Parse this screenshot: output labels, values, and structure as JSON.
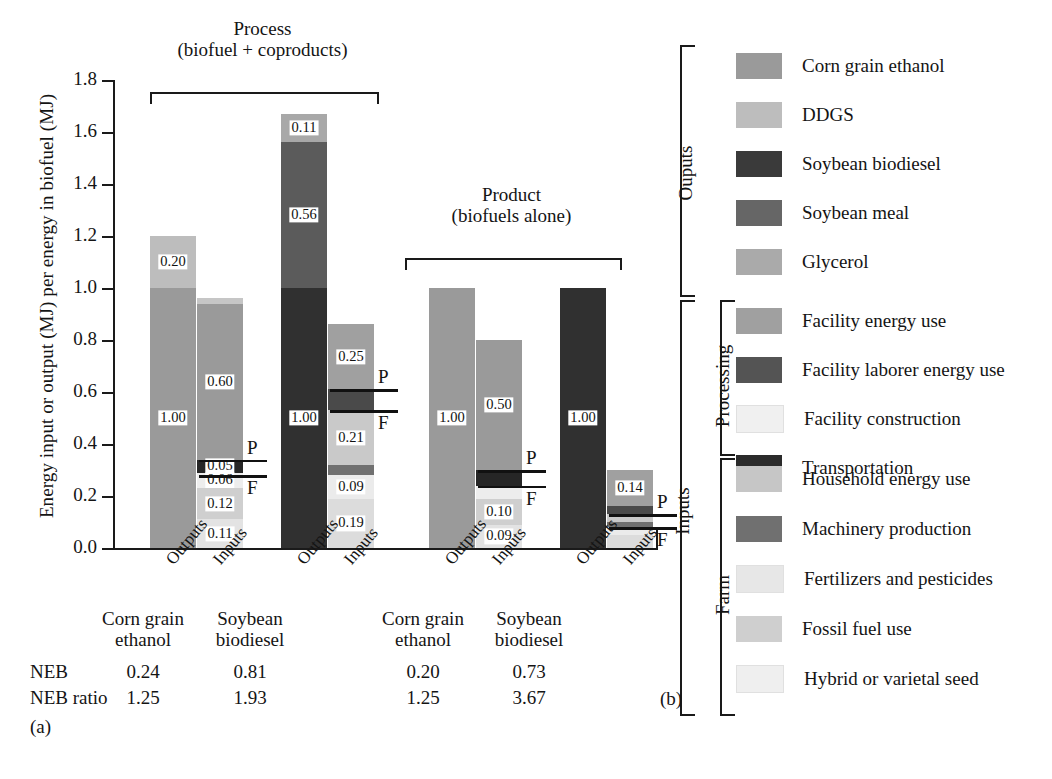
{
  "figure": {
    "panel_a_tag": "(a)",
    "panel_b_tag": "(b)",
    "ylabel": "Energy input or output (MJ) per energy in biofuel (MJ)"
  },
  "chart_data": {
    "type": "bar",
    "title": "",
    "xlabel": "",
    "ylabel": "Energy input or output (MJ) per energy in biofuel (MJ)",
    "ylim": [
      0,
      1.8
    ],
    "yticks": [
      "0.0",
      "0.2",
      "0.4",
      "0.6",
      "0.8",
      "1.0",
      "1.2",
      "1.4",
      "1.6",
      "1.8"
    ],
    "grid": false,
    "legend_position": "right",
    "stacked": true,
    "group_headers": [
      {
        "title_line1": "Process",
        "title_line2": "(biofuel + coproducts)"
      },
      {
        "title_line1": "Product",
        "title_line2": "(biofuels alone)"
      }
    ],
    "categories": [
      {
        "label_line1": "Corn grain",
        "label_line2": "ethanol"
      },
      {
        "label_line1": "Soybean",
        "label_line2": "biodiesel"
      },
      {
        "label_line1": "Corn grain",
        "label_line2": "ethanol"
      },
      {
        "label_line1": "Soybean",
        "label_line2": "biodiesel"
      }
    ],
    "bar_axis_labels": [
      "Outputs",
      "Inputs",
      "Outputs",
      "Inputs",
      "Outputs",
      "Inputs",
      "Outputs",
      "Inputs"
    ],
    "bars": [
      {
        "group": "Process",
        "crop": "Corn grain ethanol",
        "side": "Outputs",
        "total": 1.2,
        "segments": [
          {
            "series": "Corn grain ethanol",
            "value": 1.0,
            "label": "1.00",
            "color": "#9a9a9a"
          },
          {
            "series": "DDGS",
            "value": 0.2,
            "label": "0.20",
            "color": "#bdbdbd"
          }
        ]
      },
      {
        "group": "Process",
        "crop": "Corn grain ethanol",
        "side": "Inputs",
        "total": 0.96,
        "segments": [
          {
            "series": "Hybrid or varietal seed",
            "value": 0.11,
            "label": "0.11",
            "color": "#e3e3e3"
          },
          {
            "series": "Fossil fuel use",
            "value": 0.12,
            "label": "0.12",
            "color": "#cfcfcf"
          },
          {
            "series": "Fertilizers and pesticides",
            "value": 0.06,
            "label": "0.06",
            "color": "#ededed"
          },
          {
            "series": "Machinery production",
            "value": 0.05,
            "label": "0.05",
            "color": "#262626"
          },
          {
            "series": "Facility energy use",
            "value": 0.6,
            "label": "0.60",
            "color": "#9a9a9a"
          },
          {
            "series": "Household energy use",
            "value": 0.02,
            "label": "",
            "color": "#c6c6c6"
          }
        ],
        "pf_marks": [
          {
            "mark": "P",
            "value": 0.34
          },
          {
            "mark": "F",
            "value": 0.28
          }
        ]
      },
      {
        "group": "Process",
        "crop": "Soybean biodiesel",
        "side": "Outputs",
        "total": 1.67,
        "segments": [
          {
            "series": "Soybean biodiesel",
            "value": 1.0,
            "label": "1.00",
            "color": "#303030"
          },
          {
            "series": "Soybean meal",
            "value": 0.56,
            "label": "0.56",
            "color": "#5b5b5b"
          },
          {
            "series": "Glycerol",
            "value": 0.11,
            "label": "0.11",
            "color": "#a8a8a8"
          }
        ]
      },
      {
        "group": "Process",
        "crop": "Soybean biodiesel",
        "side": "Inputs",
        "total": 0.86,
        "segments": [
          {
            "series": "Hybrid or varietal seed",
            "value": 0.19,
            "label": "0.19",
            "color": "#dcdcdc"
          },
          {
            "series": "Fossil fuel use",
            "value": 0.09,
            "label": "0.09",
            "color": "#ebebeb"
          },
          {
            "series": "Machinery production",
            "value": 0.04,
            "label": "",
            "color": "#707070"
          },
          {
            "series": "Facility construction",
            "value": 0.21,
            "label": "0.21",
            "color": "#c9c9c9"
          },
          {
            "series": "Facility laborer energy use",
            "value": 0.08,
            "label": "",
            "color": "#4a4a4a"
          },
          {
            "series": "Facility energy use",
            "value": 0.25,
            "label": "0.25",
            "color": "#a0a0a0"
          }
        ],
        "pf_marks": [
          {
            "mark": "P",
            "value": 0.61
          },
          {
            "mark": "F",
            "value": 0.53
          }
        ]
      },
      {
        "group": "Product",
        "crop": "Corn grain ethanol",
        "side": "Outputs",
        "total": 1.0,
        "segments": [
          {
            "series": "Corn grain ethanol",
            "value": 1.0,
            "label": "1.00",
            "color": "#9a9a9a"
          }
        ]
      },
      {
        "group": "Product",
        "crop": "Corn grain ethanol",
        "side": "Inputs",
        "total": 0.8,
        "segments": [
          {
            "series": "Hybrid or varietal seed",
            "value": 0.09,
            "label": "0.09",
            "color": "#e3e3e3"
          },
          {
            "series": "Fossil fuel use",
            "value": 0.1,
            "label": "0.10",
            "color": "#cfcfcf"
          },
          {
            "series": "Fertilizers and pesticides",
            "value": 0.05,
            "label": "",
            "color": "#ededed"
          },
          {
            "series": "Machinery production",
            "value": 0.06,
            "label": "",
            "color": "#262626"
          },
          {
            "series": "Facility energy use",
            "value": 0.5,
            "label": "0.50",
            "color": "#9a9a9a"
          }
        ],
        "pf_marks": [
          {
            "mark": "P",
            "value": 0.3
          },
          {
            "mark": "F",
            "value": 0.24
          }
        ]
      },
      {
        "group": "Product",
        "crop": "Soybean biodiesel",
        "side": "Outputs",
        "total": 1.0,
        "segments": [
          {
            "series": "Soybean biodiesel",
            "value": 1.0,
            "label": "1.00",
            "color": "#303030"
          }
        ]
      },
      {
        "group": "Product",
        "crop": "Soybean biodiesel",
        "side": "Inputs",
        "total": 0.27,
        "segments": [
          {
            "series": "Hybrid or varietal seed",
            "value": 0.05,
            "label": "",
            "color": "#dcdcdc"
          },
          {
            "series": "Fossil fuel use",
            "value": 0.03,
            "label": "",
            "color": "#ebebeb"
          },
          {
            "series": "Machinery production",
            "value": 0.02,
            "label": "",
            "color": "#707070"
          },
          {
            "series": "Facility construction",
            "value": 0.03,
            "label": "",
            "color": "#c9c9c9"
          },
          {
            "series": "Facility laborer energy use",
            "value": 0.03,
            "label": "",
            "color": "#4a4a4a"
          },
          {
            "series": "Facility energy use",
            "value": 0.14,
            "label": "0.14",
            "color": "#a0a0a0"
          }
        ],
        "pf_marks": [
          {
            "mark": "P",
            "value": 0.13
          },
          {
            "mark": "F",
            "value": 0.08
          }
        ]
      }
    ],
    "neb_table": {
      "rows": [
        {
          "key": "NEB",
          "values": [
            "0.24",
            "0.81",
            "0.20",
            "0.73"
          ]
        },
        {
          "key": "NEB ratio",
          "values": [
            "1.25",
            "1.93",
            "1.25",
            "3.67"
          ]
        }
      ]
    }
  },
  "legend": {
    "outputs_label": "Ouputs",
    "inputs_label": "Inputs",
    "processing_label": "Processing",
    "farm_label": "Farm",
    "outputs": [
      {
        "label": "Corn grain ethanol",
        "color": "#9a9a9a"
      },
      {
        "label": "DDGS",
        "color": "#bdbdbd"
      },
      {
        "label": "Soybean biodiesel",
        "color": "#3a3a3a"
      },
      {
        "label": "Soybean meal",
        "color": "#666666"
      },
      {
        "label": "Glycerol",
        "color": "#aaaaaa"
      }
    ],
    "processing": [
      {
        "label": "Facility energy use",
        "color": "#a0a0a0"
      },
      {
        "label": "Facility laborer energy use",
        "color": "#545454"
      },
      {
        "label": "Facility construction",
        "color": "#f0f0f0"
      },
      {
        "label": "Transportation",
        "color": "#2b2b2b"
      }
    ],
    "farm": [
      {
        "label": "Household energy use",
        "color": "#c6c6c6"
      },
      {
        "label": "Machinery production",
        "color": "#707070"
      },
      {
        "label": "Fertilizers and pesticides",
        "color": "#e7e7e7"
      },
      {
        "label": "Fossil fuel use",
        "color": "#cfcfcf"
      },
      {
        "label": "Hybrid or varietal seed",
        "color": "#efefef"
      }
    ]
  }
}
